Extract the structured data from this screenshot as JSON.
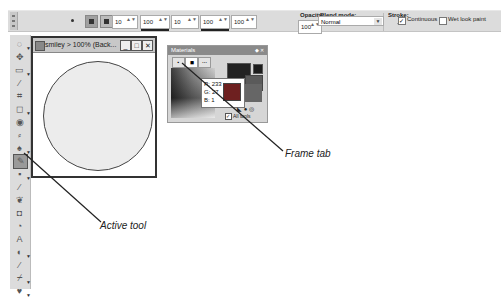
{
  "toolbar": {
    "size_value": "10",
    "hardness_value": "100",
    "step_value": "10",
    "density_value": "100",
    "thickness_value": "100",
    "opacity_label": "Opacity:",
    "opacity_value": "100",
    "blend_mode_label": "Blend mode:",
    "blend_mode_value": "Normal",
    "stroke_label": "Stroke:",
    "continuous_label": "Continuous",
    "continuous_checked": true,
    "wet_look_label": "Wet look paint",
    "wet_look_checked": false
  },
  "image_window": {
    "title": "smiley > 100% (Back...",
    "minimize": "_",
    "maximize": "□",
    "close": "✕"
  },
  "materials": {
    "title": "Materials",
    "tabs": [
      "frame-tab-1",
      "frame-tab-2",
      "swatches-tab"
    ],
    "rgb_r": "R: 233",
    "rgb_g": "G: 27",
    "rgb_b": "B: 1",
    "all_tools_label": "All tools",
    "colors": {
      "foreground": "#222222",
      "background": "#5a5a5a",
      "preview": "#6e2020"
    }
  },
  "left_tools": [
    "pan",
    "move",
    "selection",
    "dropper",
    "crop",
    "shape-select",
    "eye",
    "brush",
    "paint-dropdown",
    "paintbrush-active",
    "airbrush",
    "pen",
    "bucket",
    "eraser",
    "blob",
    "text",
    "shape",
    "pencil",
    "clone",
    "scratch"
  ],
  "callouts": {
    "frame_tab": "Frame tab",
    "active_tool": "Active tool"
  }
}
